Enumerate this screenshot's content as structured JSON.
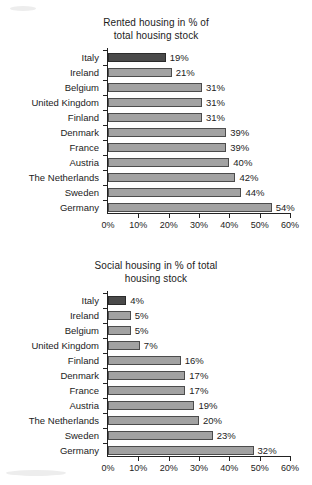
{
  "chart_data": [
    {
      "id": "rented-housing",
      "type": "bar",
      "orientation": "horizontal",
      "title": "Rented housing in % of total housing stock",
      "title_line1": "Rented housing in % of",
      "title_line2": "total housing stock",
      "xlabel": "",
      "ylabel": "",
      "xlim": [
        0,
        60
      ],
      "grid": false,
      "legend": "none",
      "tick_labels": [
        "0%",
        "10%",
        "20%",
        "30%",
        "40%",
        "50%",
        "60%"
      ],
      "tick_values": [
        0,
        10,
        20,
        30,
        40,
        50,
        60
      ],
      "categories": [
        "Italy",
        "Ireland",
        "Belgium",
        "United Kingdom",
        "Finland",
        "Denmark",
        "France",
        "Austria",
        "The Netherlands",
        "Sweden",
        "Germany"
      ],
      "values": [
        19,
        21,
        31,
        31,
        31,
        39,
        39,
        40,
        42,
        44,
        54
      ],
      "value_labels": [
        "19%",
        "21%",
        "31%",
        "31%",
        "31%",
        "39%",
        "39%",
        "40%",
        "42%",
        "44%",
        "54%"
      ],
      "bar_draw_scale": 1.0,
      "highlight_category": "Italy"
    },
    {
      "id": "social-housing",
      "type": "bar",
      "orientation": "horizontal",
      "title": "Social housing in % of total housing stock",
      "title_line1": "Social housing in % of total",
      "title_line2": "housing stock",
      "xlabel": "",
      "ylabel": "",
      "xlim": [
        0,
        60
      ],
      "grid": false,
      "legend": "none",
      "tick_labels": [
        "0%",
        "10%",
        "20%",
        "30%",
        "40%",
        "50%",
        "60%"
      ],
      "tick_values": [
        0,
        10,
        20,
        30,
        40,
        50,
        60
      ],
      "categories": [
        "Italy",
        "Ireland",
        "Belgium",
        "United Kingdom",
        "Finland",
        "Denmark",
        "France",
        "Austria",
        "The Netherlands",
        "Sweden",
        "Germany"
      ],
      "values": [
        4,
        5,
        5,
        7,
        16,
        17,
        17,
        19,
        20,
        23,
        32
      ],
      "value_labels": [
        "4%",
        "5%",
        "5%",
        "7%",
        "16%",
        "17%",
        "17%",
        "19%",
        "20%",
        "23%",
        "32%"
      ],
      "bar_draw_scale": 1.5,
      "highlight_category": "Italy"
    }
  ],
  "colors": {
    "bar_fill": "#a2a2a2",
    "bar_border": "#4c4c4c",
    "highlight_fill": "#4a4a4a",
    "axis": "#222222",
    "text": "#1c1c1c",
    "background": "#ffffff"
  }
}
